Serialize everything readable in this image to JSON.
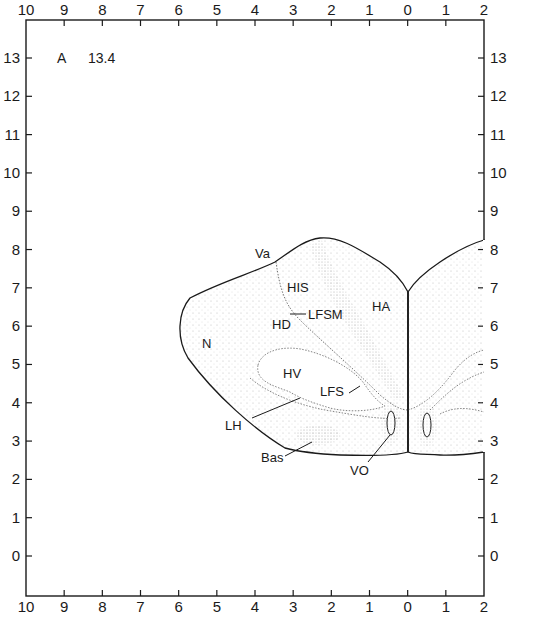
{
  "plate": {
    "letter": "A",
    "number": "13.4"
  },
  "axes": {
    "top_labels": [
      "10",
      "9",
      "8",
      "7",
      "6",
      "5",
      "4",
      "3",
      "2",
      "1",
      "0",
      "1",
      "2"
    ],
    "bottom_labels": [
      "10",
      "9",
      "8",
      "7",
      "6",
      "5",
      "4",
      "3",
      "2",
      "1",
      "0",
      "1",
      "2"
    ],
    "left_labels": [
      "13",
      "12",
      "11",
      "10",
      "9",
      "8",
      "7",
      "6",
      "5",
      "4",
      "3",
      "2",
      "1",
      "0"
    ],
    "right_labels": [
      "13",
      "12",
      "11",
      "10",
      "9",
      "8",
      "7",
      "6",
      "5",
      "4",
      "3",
      "2",
      "1",
      "0"
    ]
  },
  "regions": {
    "Va": "Va",
    "HIS": "HIS",
    "HA": "HA",
    "LFSM": "LFSM",
    "HD": "HD",
    "N": "N",
    "HV": "HV",
    "LFS": "LFS",
    "LH": "LH",
    "Bas": "Bas",
    "VO": "VO"
  },
  "colors": {
    "ink": "#1a1a1a",
    "stipple": "#9a9a9a",
    "background": "#ffffff"
  }
}
